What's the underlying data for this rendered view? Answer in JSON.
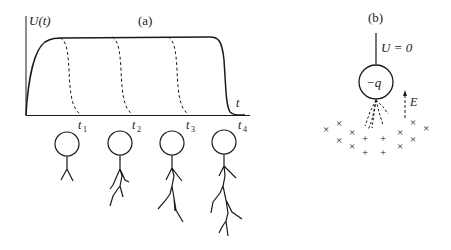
{
  "panel_a": {
    "label": "(a)",
    "y_axis_label": "U(t)",
    "x_axis_label": "t",
    "time_marks": [
      {
        "label": "t",
        "sub": "1"
      },
      {
        "label": "t",
        "sub": "2"
      },
      {
        "label": "t",
        "sub": "3"
      },
      {
        "label": "t",
        "sub": "4"
      }
    ],
    "figures": [
      {
        "name": "figure-t1"
      },
      {
        "name": "figure-t2"
      },
      {
        "name": "figure-t3"
      },
      {
        "name": "figure-t4"
      }
    ]
  },
  "panel_b": {
    "label": "(b)",
    "potential_label": "U = 0",
    "charge_label": "−q",
    "field_label": "E",
    "negative_marker": "×",
    "positive_marker": "+"
  },
  "colors": {
    "ink": "#1a1a1a",
    "background": "#ffffff"
  }
}
